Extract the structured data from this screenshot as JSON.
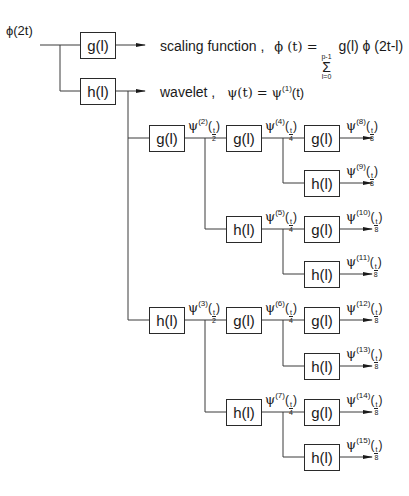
{
  "input_label": "ϕ(2t)",
  "filters": {
    "g": "g(l)",
    "h": "h(l)"
  },
  "top": {
    "scaling_text": "scaling function  ,",
    "scaling_eq_lhs": "ϕ (t) =",
    "sum_upper": "p-1",
    "sum_symbol": "Σ",
    "sum_lower": "l=0",
    "scaling_eq_rhs": "g(l) ϕ (2t-l)",
    "wavelet_text": "wavelet ,",
    "wavelet_eq": "ψ(t) = ψ",
    "wavelet_sup": "(1)",
    "wavelet_tail": "(t)"
  },
  "psi_symbol": "ψ",
  "frac_num": "t",
  "nodes": [
    {
      "id": "psi2",
      "sup": "(2)",
      "den": "2"
    },
    {
      "id": "psi3",
      "sup": "(3)",
      "den": "2"
    },
    {
      "id": "psi4",
      "sup": "(4)",
      "den": "4"
    },
    {
      "id": "psi5",
      "sup": "(5)",
      "den": "4"
    },
    {
      "id": "psi6",
      "sup": "(6)",
      "den": "4"
    },
    {
      "id": "psi7",
      "sup": "(7)",
      "den": "4"
    },
    {
      "id": "psi8",
      "sup": "(8)",
      "den": "8"
    },
    {
      "id": "psi9",
      "sup": "(9)",
      "den": "8"
    },
    {
      "id": "psi10",
      "sup": "(10)",
      "den": "8"
    },
    {
      "id": "psi11",
      "sup": "(11)",
      "den": "8"
    },
    {
      "id": "psi12",
      "sup": "(12)",
      "den": "8"
    },
    {
      "id": "psi13",
      "sup": "(13)",
      "den": "8"
    },
    {
      "id": "psi14",
      "sup": "(14)",
      "den": "8"
    },
    {
      "id": "psi15",
      "sup": "(15)",
      "den": "8"
    }
  ]
}
